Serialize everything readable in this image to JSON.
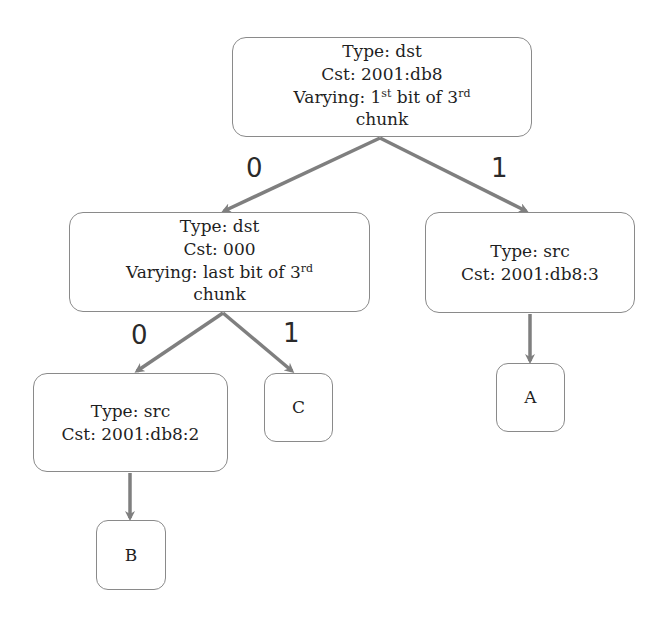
{
  "diagram": {
    "type": "decision-tree",
    "colors": {
      "edge": "#7f7f7f",
      "border": "#8a8a8a",
      "text": "#1f1f1f"
    },
    "nodes": {
      "root": {
        "type_line": "Type: dst",
        "cst_line": "Cst: 2001:db8",
        "varying_prefix": "Varying: 1",
        "varying_sup1": "st",
        "varying_mid": " bit of 3",
        "varying_sup2": "rd",
        "varying_last": "chunk"
      },
      "left": {
        "type_line": "Type: dst",
        "cst_line": "Cst: 000",
        "varying_prefix": "Varying: last bit of 3",
        "varying_sup": "rd",
        "varying_last": "chunk"
      },
      "right": {
        "type_line": "Type: src",
        "cst_line": "Cst: 2001:db8:3"
      },
      "left_left": {
        "type_line": "Type: src",
        "cst_line": "Cst: 2001:db8:2"
      },
      "leaf_a": {
        "label": "A"
      },
      "leaf_b": {
        "label": "B"
      },
      "leaf_c": {
        "label": "C"
      }
    },
    "edge_labels": {
      "root_to_left": "0",
      "root_to_right": "1",
      "left_to_left_left": "0",
      "left_to_c": "1"
    }
  }
}
